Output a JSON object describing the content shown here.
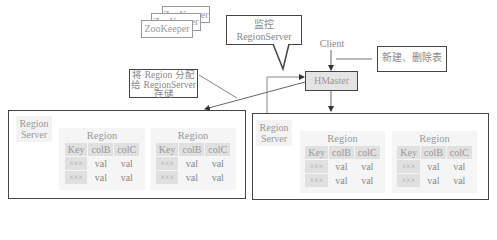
{
  "zookeeper": {
    "nodes": [
      {
        "label": "ZooKeeper"
      },
      {
        "label": "ZooKeeper"
      },
      {
        "label": "ZooKeeper"
      }
    ]
  },
  "callouts": {
    "monitor": {
      "line1": "监控",
      "line2": "RegionServer"
    },
    "assign": {
      "line1": "将 Region 分配",
      "line2": "给 RegionServer",
      "line3": "存储"
    },
    "create_delete": {
      "label": "新建、删除表"
    }
  },
  "client": {
    "label": "Client"
  },
  "hmaster": {
    "label": "HMaster"
  },
  "colors": {
    "line": "#555555",
    "box_border": "#444444",
    "hmaster_fill": "#e4e4e4",
    "cell_fill": "#e0e0e0",
    "region_fill": "#f5f5f5"
  },
  "servers": [
    {
      "label_line1": "Region",
      "label_line2": "Server",
      "regions": [
        {
          "title": "Region",
          "headers": [
            "Key",
            "colB",
            "colC"
          ],
          "rows": [
            [
              "×××",
              "val",
              "val"
            ],
            [
              "×××",
              "val",
              "val"
            ]
          ]
        },
        {
          "title": "Region",
          "headers": [
            "Key",
            "colB",
            "colC"
          ],
          "rows": [
            [
              "×××",
              "val",
              "val"
            ],
            [
              "×××",
              "val",
              "val"
            ]
          ]
        }
      ]
    },
    {
      "label_line1": "Region",
      "label_line2": "Server",
      "regions": [
        {
          "title": "Region",
          "headers": [
            "Key",
            "colB",
            "colC"
          ],
          "rows": [
            [
              "×××",
              "val",
              "val"
            ],
            [
              "×××",
              "val",
              "val"
            ]
          ]
        },
        {
          "title": "Region",
          "headers": [
            "Key",
            "colB",
            "colC"
          ],
          "rows": [
            [
              "×××",
              "val",
              "val"
            ],
            [
              "×××",
              "val",
              "val"
            ]
          ]
        }
      ]
    }
  ]
}
